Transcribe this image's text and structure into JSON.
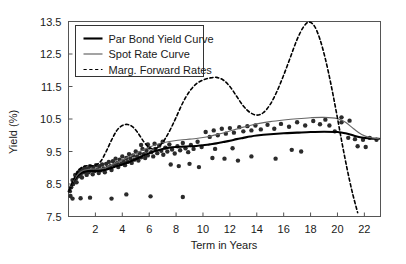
{
  "chart_data": {
    "type": "line",
    "title": "",
    "subtitle": "",
    "xlabel": "Term in Years",
    "ylabel": "Yield (%)",
    "xlim": [
      0,
      23.2
    ],
    "ylim": [
      7.5,
      13.5
    ],
    "xticks": [
      2,
      4,
      6,
      8,
      10,
      12,
      14,
      16,
      18,
      20,
      22
    ],
    "xtick_labels": [
      "2",
      "4",
      "6",
      "8",
      "10",
      "12",
      "14",
      "16",
      "18",
      "20",
      "22"
    ],
    "yticks": [
      7.5,
      8.5,
      9.5,
      10.5,
      11.5,
      12.5,
      13.5
    ],
    "ytick_labels": [
      "7.5",
      "8.5",
      "9.5",
      "10.5",
      "11.5",
      "12.5",
      "13.5"
    ],
    "grid": false,
    "legend_position": "upper left",
    "legend": [
      {
        "label": "Par Bond Yield Curve",
        "style": "solid",
        "width": "thick",
        "color": "#000000"
      },
      {
        "label": "Spot Rate Curve",
        "style": "solid",
        "width": "thin",
        "color": "#666666"
      },
      {
        "label": "Marg. Forward Rates",
        "style": "dashed",
        "width": "thin",
        "color": "#000000"
      }
    ],
    "series": [
      {
        "name": "Par Bond Yield Curve",
        "style": "solid",
        "color": "#000000",
        "x": [
          0.05,
          0.3,
          0.6,
          0.9,
          1.2,
          1.5,
          1.8,
          2.1,
          2.4,
          2.8,
          3.2,
          3.6,
          4.0,
          4.4,
          4.8,
          5.2,
          5.6,
          6.0,
          6.5,
          7.0,
          7.5,
          8.0,
          8.5,
          9.0,
          9.5,
          10.0,
          10.5,
          11.0,
          11.5,
          12.0,
          12.5,
          13.0,
          13.5,
          14.0,
          15.0,
          16.0,
          17.0,
          18.0,
          19.0,
          20.0,
          20.6,
          21.2,
          21.8,
          22.4,
          23.1
        ],
        "y": [
          8.28,
          8.52,
          8.72,
          8.83,
          8.88,
          8.9,
          8.9,
          8.9,
          8.91,
          8.94,
          8.99,
          9.05,
          9.1,
          9.16,
          9.23,
          9.3,
          9.38,
          9.45,
          9.52,
          9.58,
          9.62,
          9.64,
          9.65,
          9.66,
          9.67,
          9.69,
          9.72,
          9.75,
          9.79,
          9.83,
          9.88,
          9.92,
          9.96,
          9.99,
          10.03,
          10.06,
          10.08,
          10.1,
          10.11,
          10.1,
          10.06,
          9.99,
          9.93,
          9.9,
          9.89
        ]
      },
      {
        "name": "Spot Rate Curve",
        "style": "solid",
        "color": "#666666",
        "x": [
          0.05,
          0.3,
          0.6,
          0.9,
          1.2,
          1.5,
          1.8,
          2.1,
          2.4,
          2.8,
          3.2,
          3.6,
          4.0,
          4.4,
          4.8,
          5.2,
          5.6,
          6.0,
          6.5,
          7.0,
          7.5,
          8.0,
          8.5,
          9.0,
          9.5,
          10.0,
          10.5,
          11.0,
          11.5,
          12.0,
          12.5,
          13.0,
          13.5,
          14.0,
          15.0,
          16.0,
          17.0,
          18.0,
          19.0,
          20.0,
          20.6,
          21.2,
          21.8,
          22.4,
          23.1
        ],
        "y": [
          8.29,
          8.54,
          8.75,
          8.87,
          8.93,
          8.95,
          8.96,
          8.96,
          8.97,
          9.01,
          9.08,
          9.16,
          9.24,
          9.32,
          9.4,
          9.48,
          9.56,
          9.63,
          9.71,
          9.77,
          9.81,
          9.84,
          9.86,
          9.88,
          9.9,
          9.93,
          9.97,
          10.02,
          10.07,
          10.13,
          10.19,
          10.25,
          10.3,
          10.35,
          10.42,
          10.47,
          10.51,
          10.54,
          10.55,
          10.51,
          10.4,
          10.2,
          10.02,
          9.93,
          9.89
        ]
      },
      {
        "name": "Marg. Forward Rates",
        "style": "dashed",
        "color": "#000000",
        "x": [
          0.05,
          0.4,
          0.8,
          1.2,
          1.6,
          2.0,
          2.4,
          2.8,
          3.2,
          3.6,
          4.0,
          4.4,
          4.8,
          5.2,
          5.6,
          6.0,
          6.4,
          6.8,
          7.2,
          7.6,
          8.0,
          8.5,
          9.0,
          9.5,
          10.0,
          10.5,
          11.0,
          11.5,
          12.0,
          12.5,
          13.0,
          13.5,
          14.0,
          14.5,
          15.0,
          15.5,
          16.0,
          16.5,
          17.0,
          17.5,
          17.9,
          18.3,
          18.7,
          19.1,
          19.5,
          19.9,
          20.3,
          20.7,
          21.1,
          21.5
        ],
        "y": [
          8.3,
          8.66,
          8.94,
          9.05,
          9.06,
          9.08,
          9.2,
          9.5,
          9.85,
          10.15,
          10.3,
          10.33,
          10.25,
          10.05,
          9.8,
          9.62,
          9.58,
          9.68,
          9.9,
          10.2,
          10.55,
          11.0,
          11.35,
          11.58,
          11.7,
          11.76,
          11.78,
          11.7,
          11.5,
          11.2,
          10.9,
          10.7,
          10.62,
          10.7,
          10.95,
          11.35,
          11.85,
          12.4,
          12.95,
          13.35,
          13.48,
          13.35,
          12.95,
          12.35,
          11.6,
          10.75,
          9.85,
          9.0,
          8.25,
          7.62
        ]
      }
    ],
    "scatter": {
      "name": "observed-bond-yields",
      "marker": "filled-circle",
      "color": "#2b2b2b",
      "size": 2.2,
      "points": [
        [
          0.1,
          8.28
        ],
        [
          0.15,
          8.13
        ],
        [
          0.2,
          8.4
        ],
        [
          0.3,
          8.62
        ],
        [
          0.35,
          8.5
        ],
        [
          0.5,
          8.78
        ],
        [
          0.55,
          8.66
        ],
        [
          0.6,
          8.55
        ],
        [
          0.7,
          8.85
        ],
        [
          0.75,
          8.74
        ],
        [
          0.85,
          8.92
        ],
        [
          0.9,
          8.8
        ],
        [
          1.0,
          8.7
        ],
        [
          1.05,
          8.95
        ],
        [
          1.15,
          8.86
        ],
        [
          1.2,
          9.0
        ],
        [
          1.3,
          8.9
        ],
        [
          1.35,
          8.78
        ],
        [
          1.45,
          8.98
        ],
        [
          1.5,
          8.86
        ],
        [
          1.6,
          9.05
        ],
        [
          1.7,
          8.92
        ],
        [
          1.8,
          8.8
        ],
        [
          1.85,
          9.02
        ],
        [
          1.95,
          8.9
        ],
        [
          2.05,
          9.08
        ],
        [
          2.15,
          8.95
        ],
        [
          2.25,
          8.84
        ],
        [
          2.3,
          9.05
        ],
        [
          2.4,
          8.92
        ],
        [
          2.5,
          9.1
        ],
        [
          2.6,
          8.98
        ],
        [
          2.7,
          8.86
        ],
        [
          2.8,
          9.12
        ],
        [
          2.9,
          9.0
        ],
        [
          3.0,
          9.18
        ],
        [
          3.1,
          9.05
        ],
        [
          3.2,
          8.93
        ],
        [
          3.3,
          9.2
        ],
        [
          3.4,
          9.08
        ],
        [
          3.5,
          9.28
        ],
        [
          3.6,
          9.14
        ],
        [
          3.7,
          9.02
        ],
        [
          3.8,
          9.25
        ],
        [
          3.9,
          9.12
        ],
        [
          4.0,
          9.35
        ],
        [
          4.1,
          9.2
        ],
        [
          4.2,
          9.08
        ],
        [
          4.3,
          9.3
        ],
        [
          4.4,
          9.18
        ],
        [
          4.5,
          9.42
        ],
        [
          4.6,
          9.28
        ],
        [
          4.7,
          9.15
        ],
        [
          4.8,
          9.38
        ],
        [
          4.9,
          9.25
        ],
        [
          5.0,
          9.5
        ],
        [
          5.1,
          9.35
        ],
        [
          5.2,
          9.22
        ],
        [
          5.3,
          9.45
        ],
        [
          5.4,
          9.32
        ],
        [
          5.5,
          9.58
        ],
        [
          5.6,
          9.42
        ],
        [
          5.7,
          9.3
        ],
        [
          5.8,
          9.52
        ],
        [
          5.9,
          9.38
        ],
        [
          6.0,
          9.62
        ],
        [
          6.15,
          9.48
        ],
        [
          6.3,
          9.35
        ],
        [
          6.45,
          9.58
        ],
        [
          6.6,
          9.45
        ],
        [
          6.75,
          9.68
        ],
        [
          6.9,
          9.52
        ],
        [
          7.05,
          9.4
        ],
        [
          7.2,
          9.62
        ],
        [
          7.35,
          9.5
        ],
        [
          7.5,
          9.72
        ],
        [
          7.7,
          9.56
        ],
        [
          7.9,
          9.44
        ],
        [
          8.1,
          9.66
        ],
        [
          8.3,
          9.54
        ],
        [
          8.5,
          9.76
        ],
        [
          8.7,
          9.6
        ],
        [
          8.9,
          9.48
        ],
        [
          9.1,
          9.7
        ],
        [
          9.3,
          9.58
        ],
        [
          9.6,
          9.8
        ],
        [
          9.9,
          9.64
        ],
        [
          10.2,
          10.1
        ],
        [
          10.5,
          9.95
        ],
        [
          10.8,
          10.15
        ],
        [
          11.1,
          10.0
        ],
        [
          11.4,
          10.2
        ],
        [
          11.7,
          10.05
        ],
        [
          12.0,
          10.22
        ],
        [
          12.3,
          10.08
        ],
        [
          12.7,
          10.25
        ],
        [
          13.0,
          10.12
        ],
        [
          13.3,
          10.28
        ],
        [
          13.6,
          10.15
        ],
        [
          13.9,
          10.3
        ],
        [
          14.3,
          10.18
        ],
        [
          14.8,
          10.32
        ],
        [
          15.3,
          10.2
        ],
        [
          15.8,
          10.35
        ],
        [
          16.4,
          10.26
        ],
        [
          17.0,
          10.4
        ],
        [
          17.6,
          10.3
        ],
        [
          18.2,
          10.44
        ],
        [
          18.7,
          10.34
        ],
        [
          19.1,
          10.48
        ],
        [
          19.4,
          10.3
        ],
        [
          19.8,
          10.12
        ],
        [
          20.3,
          10.4
        ],
        [
          20.8,
          9.92
        ],
        [
          21.3,
          9.88
        ],
        [
          21.9,
          9.86
        ],
        [
          22.4,
          9.92
        ],
        [
          22.9,
          9.86
        ],
        [
          0.3,
          8.05
        ],
        [
          0.9,
          8.06
        ],
        [
          1.6,
          8.08
        ],
        [
          3.2,
          8.05
        ],
        [
          4.3,
          8.18
        ],
        [
          6.1,
          8.12
        ],
        [
          8.5,
          8.1
        ],
        [
          10.7,
          9.3
        ],
        [
          11.6,
          9.28
        ],
        [
          12.6,
          9.22
        ],
        [
          13.6,
          9.35
        ],
        [
          15.4,
          9.28
        ],
        [
          16.6,
          9.55
        ],
        [
          17.3,
          9.5
        ],
        [
          20.3,
          10.55
        ],
        [
          20.9,
          10.45
        ],
        [
          21.5,
          9.66
        ],
        [
          22.1,
          9.64
        ],
        [
          7.6,
          9.1
        ],
        [
          8.2,
          9.05
        ],
        [
          9.0,
          9.12
        ],
        [
          9.7,
          9.02
        ],
        [
          5.4,
          9.7
        ],
        [
          5.9,
          9.72
        ],
        [
          6.4,
          9.74
        ],
        [
          7.0,
          9.8
        ],
        [
          10.9,
          9.58
        ],
        [
          12.2,
          9.6
        ]
      ]
    }
  },
  "axes": {
    "ylabel": "Yield (%)",
    "xlabel": "Term in Years"
  },
  "legend": {
    "items": [
      {
        "label": "Par Bond Yield Curve"
      },
      {
        "label": "Spot Rate Curve"
      },
      {
        "label": "Marg. Forward Rates"
      }
    ]
  },
  "colors": {
    "par_bond": "#000000",
    "spot_rate": "#666666",
    "forward_rates": "#000000",
    "scatter": "#2b2b2b",
    "axis": "#555555",
    "background": "#ffffff"
  }
}
